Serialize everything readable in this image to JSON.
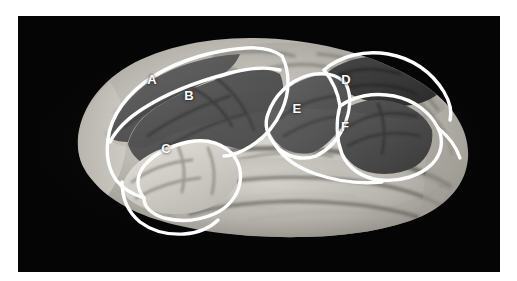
{
  "figure": {
    "orientation": "left lateral view, anterior to the left, posterior to the right",
    "modality": "grayscale photograph"
  },
  "canvas": {
    "width": 517,
    "height": 281,
    "page_background": "#ffffff",
    "plate_background": "#050505",
    "plate": {
      "left": 18,
      "top": 16,
      "width": 482,
      "height": 256
    }
  },
  "colors": {
    "outline": "#ffffff",
    "label_text": "#ffffff",
    "plate_black": "#050505",
    "shaded_region_dark": "#4f4f4f",
    "shaded_region_mid": "#6e6e6e",
    "shaded_region_darkest": "#3a3a3a",
    "brain_light": "#c9c6c0",
    "brain_highlight": "#eae7e1",
    "brain_shadow": "#8b8880"
  },
  "regions": [
    {
      "id": "A",
      "label": "A",
      "x": 152,
      "y": 79,
      "shade": "#5e5e5e",
      "description": "dorsal-most anterior outlined strip, superior frontal"
    },
    {
      "id": "B",
      "label": "B",
      "x": 189,
      "y": 95,
      "shade": "#565656",
      "description": "large anterior outlined region below A, middle frontal"
    },
    {
      "id": "C",
      "label": "C",
      "x": 166,
      "y": 148,
      "shade": "#cfccc6",
      "description": "bright outlined region, inferior frontal / pars triangularis area"
    },
    {
      "id": "D",
      "label": "D",
      "x": 346,
      "y": 79,
      "shade": "#3d3d3d",
      "description": "dark outlined region, posterior superior, parieto-occipital"
    },
    {
      "id": "E",
      "label": "E",
      "x": 297,
      "y": 108,
      "shade": "#5a5a5a",
      "description": "outlined region anterior to F, supramarginal area"
    },
    {
      "id": "F",
      "label": "F",
      "x": 345,
      "y": 126,
      "shade": "#4a4a4a",
      "description": "outlined region posterior to E, angular gyrus area"
    }
  ],
  "label_list": [
    "A",
    "B",
    "C",
    "D",
    "E",
    "F"
  ]
}
